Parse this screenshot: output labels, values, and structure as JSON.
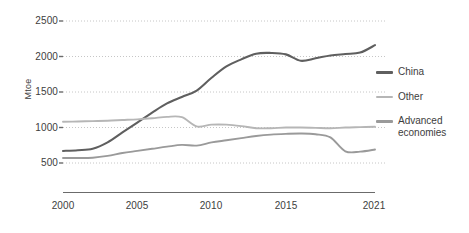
{
  "chart_data": {
    "type": "line",
    "title": "",
    "xlabel": "",
    "ylabel": "Mtoe",
    "xlim": [
      2000,
      2021
    ],
    "ylim": [
      400,
      2600
    ],
    "yticks": [
      500,
      1000,
      1500,
      2000,
      2500
    ],
    "xticks": [
      2000,
      2005,
      2010,
      2015,
      2021
    ],
    "grid": "horizontal-dotted",
    "legend_position": "right",
    "x": [
      2000,
      2001,
      2002,
      2003,
      2004,
      2005,
      2006,
      2007,
      2008,
      2009,
      2010,
      2011,
      2012,
      2013,
      2014,
      2015,
      2016,
      2017,
      2018,
      2019,
      2020,
      2021
    ],
    "series": [
      {
        "name": "China",
        "color": "#5f5f5f",
        "values": [
          670,
          680,
          700,
          790,
          930,
          1070,
          1210,
          1340,
          1430,
          1520,
          1700,
          1860,
          1960,
          2040,
          2050,
          2030,
          1940,
          1975,
          2015,
          2035,
          2055,
          2160
        ]
      },
      {
        "name": "Other",
        "color": "#b6b6b6",
        "values": [
          1080,
          1085,
          1090,
          1095,
          1105,
          1115,
          1130,
          1150,
          1145,
          1015,
          1040,
          1040,
          1020,
          990,
          990,
          1000,
          1000,
          995,
          990,
          1000,
          1005,
          1010
        ]
      },
      {
        "name": "Advanced\neconomies",
        "color": "#9a9a9a",
        "values": [
          570,
          570,
          575,
          600,
          640,
          670,
          700,
          730,
          755,
          745,
          790,
          820,
          850,
          880,
          900,
          910,
          915,
          905,
          860,
          665,
          660,
          690
        ]
      }
    ]
  },
  "axis": {
    "ylabel": "Mtoe",
    "yticks": [
      "2500",
      "2000",
      "1500",
      "1000",
      "500"
    ],
    "xticks": [
      "2000",
      "2005",
      "2010",
      "2015",
      "2021"
    ]
  },
  "legend": {
    "items": [
      {
        "label": "China",
        "color": "#5f5f5f"
      },
      {
        "label": "Other",
        "color": "#b6b6b6"
      },
      {
        "label": "Advanced\neconomies",
        "color": "#9a9a9a"
      }
    ]
  },
  "colors": {
    "china": "#5f5f5f",
    "other": "#b6b6b6",
    "advanced": "#9a9a9a",
    "grid": "#bfbfbf",
    "axis": "#6b6b6b",
    "text": "#3d3d3d",
    "background": "#ffffff"
  }
}
